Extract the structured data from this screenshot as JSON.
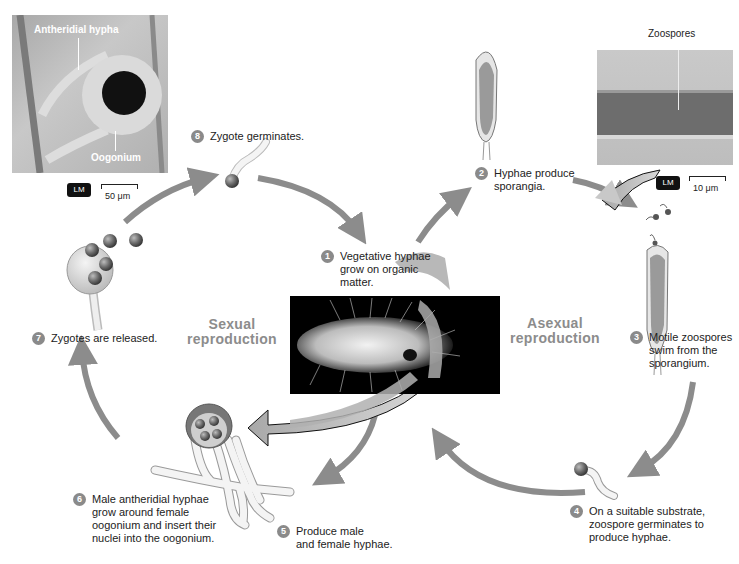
{
  "diagram": {
    "colors": {
      "arrow": "#8c8c8c",
      "badge": "#8a8a8a",
      "section_label": "#8c8c8c",
      "photo_bg": "#000000"
    },
    "sections": {
      "sexual": "Sexual\nreproduction",
      "asexual": "Asexual\nreproduction"
    },
    "steps": [
      {
        "num": "1",
        "text": "Vegetative hyphae\ngrow on organic\nmatter."
      },
      {
        "num": "2",
        "text": "Hyphae produce\nsporangia."
      },
      {
        "num": "3",
        "text": "Motile zoospores\nswim from the\nsporangium."
      },
      {
        "num": "4",
        "text": "On a suitable substrate,\nzoospore germinates to\nproduce hyphae."
      },
      {
        "num": "5",
        "text": "Produce male\nand female hyphae."
      },
      {
        "num": "6",
        "text": "Male antheridial hyphae\ngrow around female\noogonium and insert their\nnuclei into the oogonium."
      },
      {
        "num": "7",
        "text": "Zygotes are released."
      },
      {
        "num": "8",
        "text": "Zygote germinates."
      }
    ],
    "micrographs": {
      "sexual": {
        "labels": [
          "Antheridial hypha",
          "Oogonium"
        ],
        "badge": "LM",
        "scale": "50 μm"
      },
      "asexual": {
        "labels": [
          "Zoospores"
        ],
        "badge": "LM",
        "scale": "10 μm"
      }
    }
  }
}
